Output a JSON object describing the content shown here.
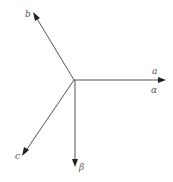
{
  "diagram": {
    "color": "#555555",
    "axes": [
      {
        "id": "a",
        "label": "a",
        "angle_deg": 0
      },
      {
        "id": "alpha",
        "label": "α",
        "angle_deg": 0
      },
      {
        "id": "b",
        "label": "b",
        "angle_deg": 120
      },
      {
        "id": "c",
        "label": "c",
        "angle_deg": 240
      },
      {
        "id": "beta",
        "label": "β",
        "angle_deg": 270
      }
    ]
  }
}
